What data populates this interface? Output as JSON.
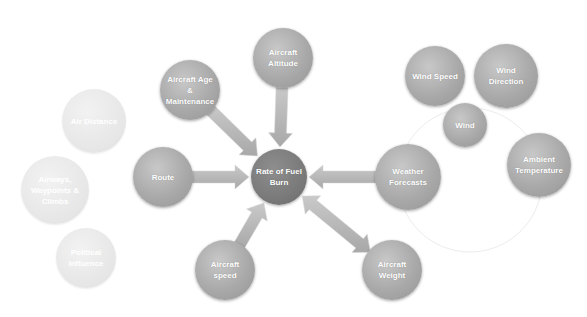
{
  "diagram": {
    "center": {
      "label": "Rate of Fuel Burn",
      "x": 279,
      "y": 177,
      "r": 28
    },
    "factors": [
      {
        "id": "altitude",
        "label": "Aircraft Altitude",
        "x": 283,
        "y": 58,
        "r": 30,
        "arrow": "to-center"
      },
      {
        "id": "age",
        "label": "Aircraft Age & Maintenance",
        "x": 190,
        "y": 90,
        "r": 30,
        "arrow": "to-center"
      },
      {
        "id": "route",
        "label": "Route",
        "x": 163,
        "y": 177,
        "r": 30,
        "arrow": "to-center"
      },
      {
        "id": "speed",
        "label": "Aircraft speed",
        "x": 225,
        "y": 270,
        "r": 30,
        "arrow": "to-center"
      },
      {
        "id": "weight",
        "label": "Aircraft Weight",
        "x": 392,
        "y": 270,
        "r": 30,
        "arrow": "bidirectional"
      },
      {
        "id": "weather",
        "label": "Weather Forecasts",
        "x": 408,
        "y": 177,
        "r": 33,
        "arrow": "to-center"
      }
    ],
    "weather_subfactors": [
      {
        "id": "wind-speed",
        "label": "Wind Speed",
        "x": 435,
        "y": 76,
        "r": 30
      },
      {
        "id": "wind-direction",
        "label": "Wind Direction",
        "x": 506,
        "y": 76,
        "r": 32
      },
      {
        "id": "wind",
        "label": "Wind",
        "x": 465,
        "y": 125,
        "r": 22
      },
      {
        "id": "ambient-temp",
        "label": "Ambient Temperature",
        "x": 539,
        "y": 165,
        "r": 32
      }
    ],
    "route_subfactors_faded": [
      {
        "id": "air-distance",
        "label": "Air Distance",
        "x": 94,
        "y": 121,
        "r": 32
      },
      {
        "id": "airways",
        "label": "Airways, Waypoints & Climbs",
        "x": 55,
        "y": 190,
        "r": 34
      },
      {
        "id": "political",
        "label": "Political Influence",
        "x": 86,
        "y": 258,
        "r": 30
      }
    ],
    "colors": {
      "node": "#a9a9a9",
      "center": "#7a7a7a",
      "faded": "#e6e6e6",
      "arrow": "#b4b4b4",
      "outline": "#eeeeee"
    }
  }
}
